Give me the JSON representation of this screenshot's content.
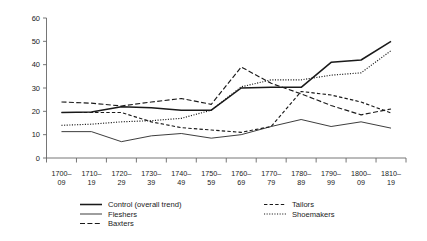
{
  "chart_data": {
    "type": "line",
    "title": "",
    "subtitle": "",
    "xlabel": "",
    "ylabel": "",
    "ylim": [
      0,
      60
    ],
    "yticks": [
      0,
      10,
      20,
      30,
      40,
      50,
      60
    ],
    "grid": false,
    "legend_position": "bottom",
    "categories": [
      "1700–09",
      "1710–19",
      "1720–29",
      "1730–39",
      "1740–49",
      "1750–59",
      "1760–69",
      "1770–79",
      "1780–89",
      "1790–99",
      "1800–09",
      "1810–19"
    ],
    "category_lines": [
      [
        "1700–",
        "09"
      ],
      [
        "1710–",
        "19"
      ],
      [
        "1720–",
        "29"
      ],
      [
        "1730–",
        "39"
      ],
      [
        "1740–",
        "49"
      ],
      [
        "1750–",
        "59"
      ],
      [
        "1760–",
        "69"
      ],
      [
        "1770–",
        "79"
      ],
      [
        "1780–",
        "89"
      ],
      [
        "1790–",
        "99"
      ],
      [
        "1800–",
        "09"
      ],
      [
        "1810–",
        "19"
      ]
    ],
    "series": [
      {
        "name": "Control (overall trend)",
        "style": "solid-thick",
        "values": [
          19.5,
          19.7,
          22.0,
          21.5,
          20.5,
          20.5,
          30.0,
          30.3,
          30.3,
          41.0,
          42.0,
          50.0
        ]
      },
      {
        "name": "Fleshers",
        "style": "solid-thin",
        "values": [
          11.3,
          11.3,
          7.0,
          9.5,
          10.5,
          8.5,
          10.0,
          13.5,
          16.5,
          13.5,
          15.5,
          12.8
        ]
      },
      {
        "name": "Baxters",
        "style": "dash-long",
        "values": [
          24.0,
          23.5,
          22.3,
          24.0,
          25.5,
          23.0,
          39.0,
          32.0,
          27.5,
          22.5,
          18.5,
          21.0
        ]
      },
      {
        "name": "Tailors",
        "style": "dash-medium",
        "values": [
          19.5,
          19.5,
          19.5,
          15.5,
          13.0,
          12.0,
          11.0,
          13.5,
          28.5,
          27.0,
          24.0,
          19.3
        ]
      },
      {
        "name": "Shoemakers",
        "style": "dotted",
        "values": [
          14.0,
          14.5,
          15.5,
          16.0,
          17.0,
          20.5,
          30.5,
          33.5,
          33.5,
          35.5,
          36.5,
          46.0
        ]
      }
    ]
  },
  "legend": {
    "items": [
      {
        "label": "Control (overall trend)",
        "style": "solid-thick",
        "column": "left"
      },
      {
        "label": "Fleshers",
        "style": "solid-thin",
        "column": "left"
      },
      {
        "label": "Baxters",
        "style": "dash-long",
        "column": "left"
      },
      {
        "label": "Tailors",
        "style": "dash-medium",
        "column": "right"
      },
      {
        "label": "Shoemakers",
        "style": "dotted",
        "column": "right"
      }
    ]
  },
  "colors": {
    "line": "#1a1a1a",
    "axis": "#666666",
    "text": "#1a1a1a",
    "background": "#ffffff"
  }
}
